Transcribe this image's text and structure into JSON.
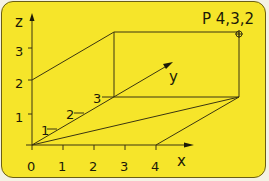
{
  "diagram": {
    "background_color": "#f6e52a",
    "line_color": "#3b3510",
    "axes": {
      "x": {
        "label": "x",
        "ticks": [
          "0",
          "1",
          "2",
          "3",
          "4"
        ]
      },
      "y": {
        "label": "y",
        "ticks": [
          "1",
          "2",
          "3"
        ]
      },
      "z": {
        "label": "z",
        "ticks": [
          "1",
          "2",
          "3"
        ]
      }
    },
    "point": {
      "label": "P 4,3,2",
      "x": 4,
      "y": 3,
      "z": 2
    }
  }
}
